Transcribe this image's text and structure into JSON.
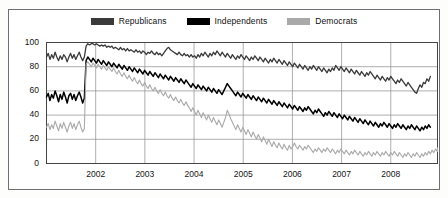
{
  "legend": {
    "position": "top-center",
    "items": [
      {
        "label": "Republicans",
        "color": "#3a3a3a",
        "key": "republicans"
      },
      {
        "label": "Independents",
        "color": "#000000",
        "key": "independents"
      },
      {
        "label": "Democrats",
        "color": "#a9a9a9",
        "key": "democrats"
      }
    ]
  },
  "axes": {
    "y_ticks": [
      "0",
      "20",
      "40",
      "60",
      "80",
      "100"
    ],
    "x_ticks": [
      "2002",
      "2003",
      "2004",
      "2005",
      "2006",
      "2007",
      "2008"
    ]
  },
  "chart_data": {
    "type": "line",
    "title": "",
    "subtitle": "",
    "xlabel": "",
    "ylabel": "",
    "xlim": [
      2001.0,
      2008.95
    ],
    "ylim": [
      0,
      100
    ],
    "grid": true,
    "gridlines_y": [
      0,
      20,
      40,
      60,
      80,
      100
    ],
    "gridlines_x": [
      2002,
      2003,
      2004,
      2005,
      2006,
      2007,
      2008
    ],
    "legend_position": "top-center",
    "x_tick_values": [
      2002,
      2003,
      2004,
      2005,
      2006,
      2007,
      2008
    ],
    "y_tick_values": [
      0,
      20,
      40,
      60,
      80,
      100
    ],
    "x_start": 2001.0,
    "x_step": 0.035,
    "series": [
      {
        "name": "Republicans",
        "color": "#3a3a3a",
        "width": 1.3,
        "values": [
          88,
          91,
          86,
          90,
          87,
          92,
          88,
          85,
          89,
          86,
          90,
          88,
          84,
          88,
          91,
          87,
          90,
          86,
          89,
          92,
          88,
          85,
          88,
          97,
          99,
          98,
          99,
          99,
          98,
          99,
          98,
          97,
          98,
          97,
          98,
          96,
          97,
          96,
          97,
          95,
          96,
          95,
          94,
          96,
          94,
          95,
          93,
          95,
          93,
          94,
          93,
          92,
          94,
          92,
          93,
          91,
          93,
          92,
          90,
          92,
          91,
          93,
          91,
          90,
          92,
          90,
          91,
          89,
          91,
          93,
          95,
          96,
          94,
          93,
          92,
          91,
          90,
          92,
          90,
          89,
          91,
          89,
          90,
          88,
          90,
          88,
          89,
          87,
          90,
          88,
          91,
          89,
          92,
          90,
          88,
          91,
          89,
          92,
          90,
          93,
          91,
          89,
          92,
          90,
          88,
          91,
          89,
          87,
          90,
          88,
          86,
          89,
          87,
          90,
          88,
          86,
          89,
          87,
          85,
          88,
          86,
          89,
          87,
          85,
          88,
          86,
          84,
          87,
          85,
          83,
          86,
          84,
          87,
          85,
          83,
          86,
          84,
          82,
          85,
          83,
          81,
          84,
          82,
          80,
          83,
          81,
          79,
          82,
          80,
          78,
          81,
          79,
          77,
          80,
          78,
          81,
          79,
          77,
          80,
          78,
          76,
          79,
          77,
          75,
          78,
          76,
          79,
          77,
          81,
          79,
          77,
          80,
          78,
          76,
          79,
          77,
          75,
          78,
          76,
          74,
          77,
          75,
          73,
          76,
          74,
          72,
          75,
          73,
          76,
          74,
          72,
          70,
          73,
          71,
          69,
          72,
          70,
          68,
          71,
          69,
          72,
          70,
          68,
          66,
          69,
          67,
          70,
          68,
          66,
          64,
          67,
          65,
          63,
          61,
          59,
          58,
          62,
          65,
          63,
          67,
          66,
          70,
          68,
          72
        ]
      },
      {
        "name": "Independents",
        "color": "#000000",
        "width": 1.5,
        "values": [
          55,
          58,
          52,
          57,
          54,
          60,
          56,
          51,
          57,
          53,
          59,
          55,
          50,
          56,
          58,
          53,
          57,
          52,
          56,
          59,
          55,
          50,
          54,
          85,
          88,
          86,
          84,
          87,
          85,
          83,
          86,
          84,
          82,
          85,
          83,
          81,
          84,
          82,
          80,
          83,
          81,
          79,
          82,
          80,
          78,
          81,
          79,
          77,
          80,
          78,
          76,
          79,
          77,
          75,
          78,
          76,
          74,
          77,
          75,
          73,
          76,
          74,
          72,
          75,
          73,
          71,
          74,
          72,
          70,
          73,
          71,
          69,
          72,
          70,
          68,
          71,
          69,
          67,
          70,
          68,
          66,
          69,
          67,
          65,
          63,
          66,
          64,
          62,
          65,
          63,
          61,
          64,
          62,
          60,
          63,
          61,
          59,
          62,
          60,
          58,
          61,
          59,
          57,
          60,
          63,
          66,
          64,
          62,
          60,
          58,
          56,
          59,
          57,
          55,
          58,
          56,
          54,
          57,
          55,
          53,
          56,
          54,
          52,
          55,
          53,
          51,
          54,
          52,
          50,
          53,
          51,
          49,
          52,
          50,
          48,
          51,
          49,
          47,
          50,
          48,
          46,
          49,
          47,
          45,
          48,
          46,
          44,
          47,
          45,
          43,
          46,
          44,
          47,
          45,
          43,
          41,
          44,
          42,
          45,
          43,
          41,
          39,
          42,
          40,
          43,
          41,
          39,
          42,
          40,
          38,
          41,
          39,
          37,
          40,
          38,
          36,
          39,
          37,
          35,
          38,
          36,
          34,
          37,
          35,
          33,
          36,
          34,
          32,
          35,
          33,
          31,
          34,
          32,
          30,
          33,
          31,
          34,
          32,
          30,
          33,
          31,
          29,
          32,
          30,
          33,
          31,
          29,
          32,
          30,
          28,
          31,
          29,
          32,
          30,
          28,
          31,
          29,
          27,
          30,
          28,
          31,
          29,
          32,
          30
        ]
      },
      {
        "name": "Democrats",
        "color": "#a9a9a9",
        "width": 1.1,
        "values": [
          30,
          33,
          28,
          32,
          29,
          35,
          31,
          27,
          33,
          29,
          34,
          30,
          26,
          31,
          34,
          29,
          33,
          28,
          32,
          35,
          30,
          26,
          29,
          82,
          84,
          82,
          80,
          83,
          81,
          79,
          82,
          80,
          78,
          81,
          79,
          77,
          80,
          78,
          76,
          79,
          76,
          74,
          77,
          74,
          72,
          75,
          72,
          70,
          73,
          70,
          68,
          71,
          68,
          66,
          69,
          66,
          64,
          67,
          64,
          62,
          65,
          62,
          60,
          63,
          60,
          58,
          61,
          58,
          56,
          59,
          56,
          54,
          57,
          54,
          52,
          55,
          52,
          50,
          53,
          50,
          48,
          51,
          48,
          46,
          43,
          46,
          43,
          40,
          44,
          41,
          38,
          42,
          39,
          36,
          40,
          37,
          34,
          38,
          35,
          32,
          36,
          33,
          30,
          34,
          38,
          44,
          41,
          37,
          34,
          31,
          28,
          32,
          29,
          26,
          30,
          27,
          24,
          28,
          25,
          22,
          26,
          23,
          20,
          24,
          21,
          18,
          22,
          19,
          16,
          20,
          17,
          14,
          18,
          15,
          13,
          17,
          14,
          12,
          16,
          13,
          11,
          15,
          12,
          14,
          17,
          14,
          12,
          15,
          13,
          11,
          14,
          12,
          15,
          13,
          11,
          9,
          12,
          10,
          13,
          11,
          9,
          12,
          10,
          13,
          11,
          9,
          12,
          10,
          8,
          11,
          9,
          12,
          10,
          8,
          11,
          9,
          7,
          10,
          8,
          11,
          9,
          7,
          10,
          8,
          6,
          9,
          7,
          10,
          8,
          6,
          9,
          7,
          10,
          8,
          6,
          9,
          7,
          10,
          8,
          6,
          9,
          7,
          10,
          8,
          6,
          9,
          7,
          5,
          8,
          6,
          9,
          7,
          5,
          8,
          6,
          9,
          7,
          5,
          8,
          6,
          9,
          7,
          10,
          8,
          11,
          9,
          12,
          10,
          13,
          11,
          12,
          10
        ]
      }
    ]
  }
}
